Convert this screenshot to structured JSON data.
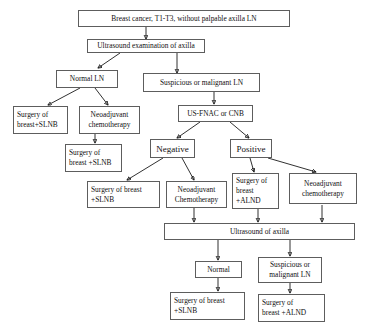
{
  "diagram": {
    "border_color": "#5d5d5d",
    "line_color": "#1a1a1a",
    "background": "#ffffff"
  },
  "nodes": {
    "root": "Breast cancer, T1-T3, without palpable axilla LN",
    "ultrasound_exam": "Ultrasound examination of axilla",
    "normal_ln": "Normal LN",
    "suspicious_ln": "Suspicious or malignant LN",
    "surgery_slnb_left": "Surgery of\nbreast+SLNB",
    "neoadjuvant_chemo_left": "Neoadjuvant\nchemotherapy",
    "surgery_slnb_left2": "Surgery of\nbreast +SLNB",
    "us_fnac_cnb": "US-FNAC or CNB",
    "negative": "Negative",
    "positive": "Positive",
    "surgery_breast_slnb_mid": "Surgery of breast\n+SLNB",
    "neoadjuvant_chemo_mid": "Neoadjuvant\nChemotherapy",
    "surgery_breast_alnd_mid": "Surgery of\nbreast\n+ALND",
    "neoadjuvant_chemo_right": "Neoadjuvant\nchemotherapy",
    "ultrasound_axilla": "Ultrasound of axilla",
    "normal_bottom": "Normal",
    "suspicious_bottom": "Suspicious or\nmalignant LN",
    "surgery_breast_slnb_bottom": "Surgery of breast\n+SLNB",
    "surgery_breast_alnd_bottom": "Surgery of\nbreast +ALND"
  }
}
